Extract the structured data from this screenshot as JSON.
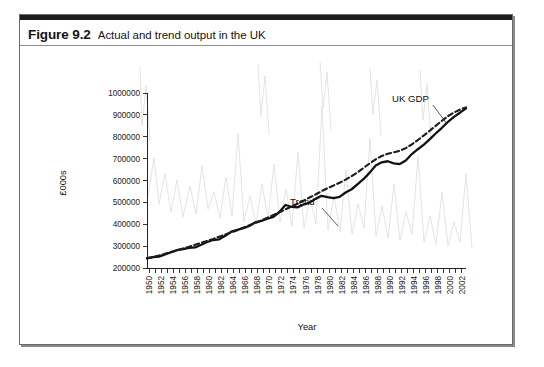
{
  "figure": {
    "caption_number": "Figure 9.2",
    "caption_text": "Actual and trend output in the UK"
  },
  "chart_data": {
    "type": "line",
    "title": "Actual and trend output in the UK",
    "xlabel": "Year",
    "ylabel": "£000s",
    "xlim": [
      1950,
      2003
    ],
    "ylim": [
      200000,
      1000000
    ],
    "grid": false,
    "legend_position": "inline-annotations",
    "y_ticks": [
      200000,
      300000,
      400000,
      500000,
      600000,
      700000,
      800000,
      900000,
      1000000
    ],
    "y_tick_labels": [
      "200000",
      "300000",
      "400000",
      "500000",
      "600000",
      "700000",
      "800000",
      "900000",
      "1000000"
    ],
    "x_ticks": [
      1950,
      1952,
      1954,
      1956,
      1958,
      1960,
      1962,
      1964,
      1966,
      1968,
      1970,
      1972,
      1974,
      1976,
      1978,
      1980,
      1982,
      1984,
      1986,
      1988,
      1990,
      1992,
      1994,
      1996,
      1998,
      2000,
      2002
    ],
    "x_tick_labels": [
      "1950",
      "1952",
      "1954",
      "1956",
      "1958",
      "1960",
      "1962",
      "1964",
      "1966",
      "1968",
      "1970",
      "1972",
      "1974",
      "1976",
      "1978",
      "1980",
      "1982",
      "1984",
      "1986",
      "1988",
      "1990",
      "1992",
      "1994",
      "1996",
      "1998",
      "2000",
      "2002"
    ],
    "annotations": [
      {
        "text": "Trend",
        "series": "Trend",
        "x": 1971,
        "y": 645000
      },
      {
        "text": "UK GDP",
        "series": "UK GDP",
        "x": 1992,
        "y": 905000
      }
    ],
    "x": [
      1950,
      1951,
      1952,
      1953,
      1954,
      1955,
      1956,
      1957,
      1958,
      1959,
      1960,
      1961,
      1962,
      1963,
      1964,
      1965,
      1966,
      1967,
      1968,
      1969,
      1970,
      1971,
      1972,
      1973,
      1974,
      1975,
      1976,
      1977,
      1978,
      1979,
      1980,
      1981,
      1982,
      1983,
      1984,
      1985,
      1986,
      1987,
      1988,
      1989,
      1990,
      1991,
      1992,
      1993,
      1994,
      1995,
      1996,
      1997,
      1998,
      1999,
      2000,
      2001,
      2002,
      2003
    ],
    "series": [
      {
        "name": "UK GDP",
        "style": "solid",
        "color": "#111111",
        "values": [
          245000,
          250000,
          252000,
          262000,
          272000,
          282000,
          286000,
          292000,
          294000,
          306000,
          319000,
          328000,
          331000,
          347000,
          366000,
          374000,
          382000,
          392000,
          409000,
          415000,
          425000,
          434000,
          456000,
          488000,
          480000,
          477000,
          490000,
          499000,
          516000,
          530000,
          524000,
          519000,
          525000,
          545000,
          560000,
          583000,
          607000,
          636000,
          669000,
          683000,
          688000,
          678000,
          675000,
          691000,
          721000,
          743000,
          764000,
          789000,
          816000,
          841000,
          868000,
          891000,
          910000,
          930000
        ]
      },
      {
        "name": "Trend",
        "style": "dashed",
        "color": "#1c1c1c",
        "values": [
          243000,
          250000,
          257000,
          265000,
          273000,
          281000,
          289000,
          297000,
          306000,
          315000,
          324000,
          333000,
          343000,
          353000,
          363000,
          373000,
          384000,
          395000,
          406000,
          418000,
          430000,
          442000,
          455000,
          468000,
          481000,
          494000,
          508000,
          522000,
          536000,
          551000,
          565000,
          577000,
          590000,
          604000,
          620000,
          638000,
          658000,
          678000,
          697000,
          712000,
          722000,
          729000,
          736000,
          748000,
          765000,
          785000,
          806000,
          828000,
          851000,
          873000,
          894000,
          911000,
          924000,
          934000
        ]
      }
    ]
  }
}
